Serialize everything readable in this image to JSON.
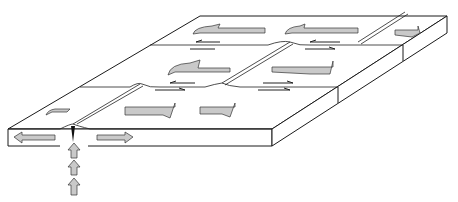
{
  "diagram": {
    "elements": [
      {
        "name": "lithosphere-slab",
        "type": "3d-block"
      },
      {
        "name": "ridge-segments",
        "count": 3
      },
      {
        "name": "transform-faults",
        "count": 2
      },
      {
        "name": "plate-motion-arrows",
        "direction": "away from ridge",
        "count": 9
      },
      {
        "name": "fault-slip-half-arrows",
        "count": 8
      },
      {
        "name": "upwelling-arrows",
        "count": 3,
        "direction": "up"
      }
    ],
    "colors": {
      "line": "#1a1a1a",
      "arrow_fill": "#c9c9c9",
      "background": "#ffffff"
    }
  }
}
